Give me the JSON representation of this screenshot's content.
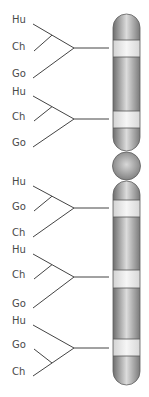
{
  "diagram": {
    "type": "chromosome-phylogeny",
    "colors": {
      "line": "#444444",
      "label": "#4a4a4a",
      "chromosome_edge": "#6e6e6e",
      "chromosome_mid": "#dcdcdc",
      "band_light": "#f1f1f1",
      "band_line": "#555555"
    },
    "trees": [
      {
        "labels": [
          "Hu",
          "Ch",
          "Go"
        ],
        "label_y": [
          20,
          47,
          74
        ],
        "root_y": 48,
        "topology": "((Hu,Ch),Go)"
      },
      {
        "labels": [
          "Hu",
          "Ch",
          "Go"
        ],
        "label_y": [
          92,
          117,
          143
        ],
        "root_y": 119,
        "topology": "((Hu,Ch),Go)"
      },
      {
        "labels": [
          "Hu",
          "Go",
          "Ch"
        ],
        "label_y": [
          182,
          207,
          233
        ],
        "root_y": 208,
        "topology": "((Hu,Go),Ch)"
      },
      {
        "labels": [
          "Hu",
          "Ch",
          "Go"
        ],
        "label_y": [
          250,
          275,
          304
        ],
        "root_y": 277,
        "topology": "((Hu,Ch),Go)"
      },
      {
        "labels": [
          "Hu",
          "Go",
          "Ch"
        ],
        "label_y": [
          321,
          345,
          372
        ],
        "root_y": 348,
        "topology": "(Hu,(Go,Ch))"
      }
    ],
    "chromosome": {
      "x": 113,
      "width": 27,
      "upper_arm": {
        "top": 14,
        "bottom": 151
      },
      "centromere": {
        "cy": 166,
        "r": 14
      },
      "lower_arm": {
        "top": 181,
        "bottom": 385
      },
      "light_bands": [
        {
          "top": 40,
          "bottom": 57
        },
        {
          "top": 111,
          "bottom": 128
        },
        {
          "top": 200,
          "bottom": 217
        },
        {
          "top": 270,
          "bottom": 288
        },
        {
          "top": 339,
          "bottom": 356
        }
      ]
    }
  }
}
